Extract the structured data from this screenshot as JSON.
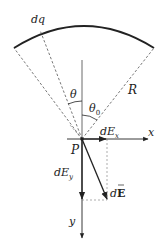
{
  "diagram": {
    "labels": {
      "dq": "dq",
      "theta": "θ",
      "theta0": "θ",
      "theta0_sub": "0",
      "R": "R",
      "P": "P",
      "dEx": "dE",
      "dEx_sub": "x",
      "x_axis": "x",
      "dEy": "dE",
      "dEy_sub": "y",
      "dE_prefix": "d",
      "dE_vec": "E",
      "y_axis": "y"
    },
    "colors": {
      "stroke": "#222222",
      "dashed": "#555555",
      "background": "#ffffff"
    }
  }
}
